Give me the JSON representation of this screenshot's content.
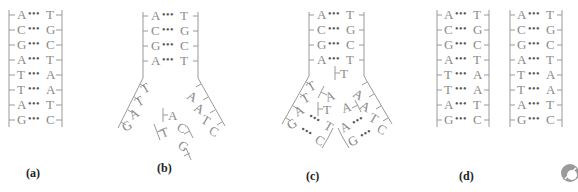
{
  "panels": {
    "a": {
      "label": "(a)",
      "pairs": [
        [
          "A",
          "T"
        ],
        [
          "C",
          "G"
        ],
        [
          "G",
          "C"
        ],
        [
          "A",
          "T"
        ],
        [
          "T",
          "A"
        ],
        [
          "T",
          "A"
        ],
        [
          "A",
          "T"
        ],
        [
          "G",
          "C"
        ]
      ]
    },
    "b": {
      "label": "(b)",
      "stem_pairs": [
        [
          "A",
          "T"
        ],
        [
          "C",
          "G"
        ],
        [
          "G",
          "C"
        ],
        [
          "A",
          "T"
        ]
      ],
      "left_arm": [
        "T",
        "T",
        "A",
        "G"
      ],
      "right_arm": [
        "A",
        "A",
        "T",
        "C"
      ],
      "new_left": [
        "A",
        "T"
      ],
      "new_right": [
        "C",
        "G"
      ]
    },
    "c": {
      "label": "(c)",
      "stem_pairs": [
        [
          "A",
          "T"
        ],
        [
          "C",
          "G"
        ],
        [
          "G",
          "C"
        ],
        [
          "A",
          "T"
        ]
      ],
      "incoming": [
        "T",
        "A",
        "T",
        "A"
      ],
      "left_arm": [
        "T",
        "T",
        "A",
        "G"
      ],
      "left_new": [
        "T",
        "C"
      ],
      "right_arm": [
        "A",
        "A",
        "T",
        "C"
      ],
      "right_new": [
        "A",
        "G"
      ]
    },
    "d": {
      "label": "(d)",
      "left_pairs": [
        [
          "A",
          "T"
        ],
        [
          "C",
          "G"
        ],
        [
          "G",
          "C"
        ],
        [
          "A",
          "T"
        ],
        [
          "T",
          "A"
        ],
        [
          "T",
          "A"
        ],
        [
          "A",
          "T"
        ],
        [
          "G",
          "C"
        ]
      ],
      "right_pairs": [
        [
          "A",
          "T"
        ],
        [
          "C",
          "G"
        ],
        [
          "G",
          "C"
        ],
        [
          "A",
          "T"
        ],
        [
          "T",
          "A"
        ],
        [
          "T",
          "A"
        ],
        [
          "A",
          "T"
        ],
        [
          "G",
          "C"
        ]
      ]
    }
  },
  "dots": "•••",
  "corner_icon": "logo-icon"
}
